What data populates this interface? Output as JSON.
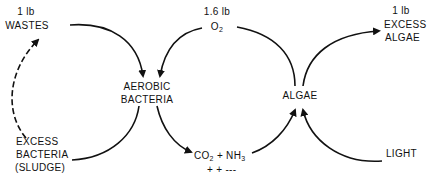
{
  "diagram": {
    "type": "process-cycle",
    "nodes": {
      "wastes": {
        "amount": "1 lb",
        "label": "WASTES"
      },
      "oxygen": {
        "amount": "1.6 lb",
        "label_main": "O",
        "label_sub": "2"
      },
      "excess_algae": {
        "amount": "1 lb",
        "line1": "EXCESS",
        "line2": "ALGAE"
      },
      "aerobic_bacteria": {
        "line1": "AEROBIC",
        "line2": "BACTERIA"
      },
      "algae": {
        "label": "ALGAE"
      },
      "excess_bacteria": {
        "line1": "EXCESS",
        "line2": "BACTERIA",
        "line3": "(SLUDGE)"
      },
      "products": {
        "co": "CO",
        "co_sub": "2",
        "plus": " + NH",
        "nh_sub": "3",
        "line2": "+ + ---"
      },
      "light": {
        "label": "LIGHT"
      }
    },
    "edges": [
      {
        "from": "wastes",
        "to": "aerobic_bacteria",
        "style": "solid"
      },
      {
        "from": "oxygen",
        "to": "aerobic_bacteria",
        "style": "solid"
      },
      {
        "from": "aerobic_bacteria",
        "to": "products",
        "style": "solid"
      },
      {
        "from": "aerobic_bacteria",
        "to": "excess_bacteria",
        "style": "solid"
      },
      {
        "from": "excess_bacteria",
        "to": "wastes",
        "style": "dashed"
      },
      {
        "from": "products",
        "to": "algae",
        "style": "solid"
      },
      {
        "from": "light",
        "to": "algae",
        "style": "solid"
      },
      {
        "from": "algae",
        "to": "oxygen",
        "style": "solid"
      },
      {
        "from": "algae",
        "to": "excess_algae",
        "style": "solid"
      }
    ],
    "colors": {
      "ink": "#111111",
      "background": "#ffffff"
    }
  }
}
